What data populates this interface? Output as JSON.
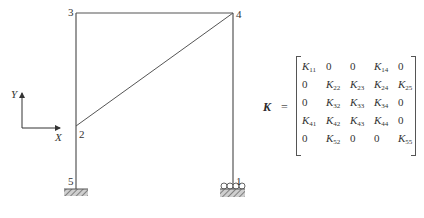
{
  "figure": {
    "nodes": [
      {
        "id": "1",
        "label": "1",
        "x": 233,
        "y": 190,
        "support": "roller"
      },
      {
        "id": "2",
        "label": "2",
        "x": 76,
        "y": 126
      },
      {
        "id": "3",
        "label": "3",
        "x": 76,
        "y": 13
      },
      {
        "id": "4",
        "label": "4",
        "x": 233,
        "y": 13
      },
      {
        "id": "5",
        "label": "5",
        "x": 76,
        "y": 190,
        "support": "fixed"
      }
    ],
    "members": [
      [
        "5",
        "2"
      ],
      [
        "2",
        "3"
      ],
      [
        "3",
        "4"
      ],
      [
        "4",
        "1"
      ],
      [
        "2",
        "4"
      ]
    ],
    "axes": {
      "x_label": "X",
      "y_label": "Y"
    }
  },
  "matrix": {
    "symbol": "K",
    "equals": "=",
    "rows": [
      [
        {
          "b": "K",
          "s": "11"
        },
        {
          "b": "0"
        },
        {
          "b": "0"
        },
        {
          "b": "K",
          "s": "14"
        },
        {
          "b": "0"
        }
      ],
      [
        {
          "b": "0"
        },
        {
          "b": "K",
          "s": "22"
        },
        {
          "b": "K",
          "s": "23"
        },
        {
          "b": "K",
          "s": "24"
        },
        {
          "b": "K",
          "s": "25"
        }
      ],
      [
        {
          "b": "0"
        },
        {
          "b": "K",
          "s": "32"
        },
        {
          "b": "K",
          "s": "33"
        },
        {
          "b": "K",
          "s": "34"
        },
        {
          "b": "0"
        }
      ],
      [
        {
          "b": "K",
          "s": "41"
        },
        {
          "b": "K",
          "s": "42"
        },
        {
          "b": "K",
          "s": "43"
        },
        {
          "b": "K",
          "s": "44"
        },
        {
          "b": "0"
        }
      ],
      [
        {
          "b": "0"
        },
        {
          "b": "K",
          "s": "52"
        },
        {
          "b": "0"
        },
        {
          "b": "0"
        },
        {
          "b": "K",
          "s": "55"
        }
      ]
    ]
  }
}
